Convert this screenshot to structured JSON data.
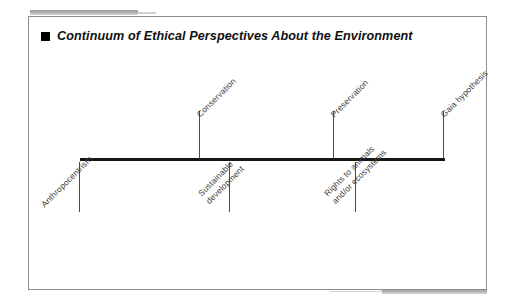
{
  "figure": {
    "title": "Continuum of Ethical Perspectives About the Environment",
    "bullet_icon": "black-square-bullet-icon"
  },
  "chart_data": {
    "type": "diagram",
    "subtype": "continuum-timeline",
    "title": "Continuum of Ethical Perspectives About the Environment",
    "xlabel": "",
    "ylabel": "",
    "axis": {
      "orientation": "horizontal",
      "x_start_px": 79,
      "x_end_px": 443,
      "y_px": 159,
      "grid": false,
      "ticks_shown": true,
      "tick_labels": false
    },
    "legend": null,
    "categories": [
      "Anthropocentrism",
      "Conservation",
      "Sustainable development",
      "Preservation",
      "Rights to animals and/or ecosystems",
      "Gaia hypothesis"
    ],
    "points": [
      {
        "label": "Anthropocentrism",
        "lines": [
          "Anthropocentrism"
        ],
        "position": 0.0,
        "side": "below",
        "x_px": 79
      },
      {
        "label": "Conservation",
        "lines": [
          "Conservation"
        ],
        "position": 0.33,
        "side": "above",
        "x_px": 199
      },
      {
        "label": "Sustainable development",
        "lines": [
          "Sustainable",
          "development"
        ],
        "position": 0.41,
        "side": "below",
        "x_px": 229
      },
      {
        "label": "Preservation",
        "lines": [
          "Preservation"
        ],
        "position": 0.7,
        "side": "above",
        "x_px": 333
      },
      {
        "label": "Rights to animals and/or ecosystems",
        "lines": [
          "Rights to animals",
          "and/or ecosystems"
        ],
        "position": 0.76,
        "side": "below",
        "x_px": 355
      },
      {
        "label": "Gaia hypothesis",
        "lines": [
          "Gaia hypothesis"
        ],
        "position": 1.0,
        "side": "above",
        "x_px": 443
      }
    ],
    "annotations": [],
    "colors": {
      "axis": "#151515",
      "tick": "#4a4a4a",
      "label": "#3b3b3b",
      "frame": "#8d8d8d",
      "accent_rule": "#9a9a9a"
    }
  }
}
